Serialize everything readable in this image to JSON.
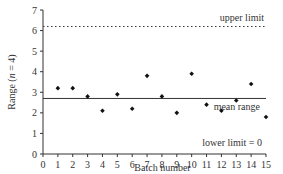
{
  "chart_data": {
    "type": "scatter",
    "title": "",
    "xlabel": "Batch number",
    "ylabel": "Range (n = 4)",
    "ylabel_parts": {
      "prefix": "Range (",
      "italic": "n",
      "suffix": " = 4)"
    },
    "xlim": [
      0,
      15
    ],
    "ylim": [
      0,
      7
    ],
    "x_ticks": [
      0,
      1,
      2,
      3,
      4,
      5,
      6,
      7,
      8,
      9,
      10,
      11,
      12,
      13,
      14,
      15
    ],
    "y_ticks": [
      0,
      1,
      2,
      3,
      4,
      5,
      6,
      7
    ],
    "grid": false,
    "x": [
      1,
      2,
      3,
      4,
      5,
      6,
      7,
      8,
      9,
      10,
      11,
      12,
      13,
      14,
      15
    ],
    "values": [
      3.2,
      3.2,
      2.8,
      2.1,
      2.9,
      2.2,
      3.8,
      2.8,
      2.0,
      3.9,
      2.4,
      2.1,
      2.6,
      3.4,
      1.8
    ],
    "reference_lines": [
      {
        "name": "upper limit",
        "value": 6.2,
        "style": "dotted",
        "label": "upper limit"
      },
      {
        "name": "mean range",
        "value": 2.7,
        "style": "solid",
        "label": "mean range"
      },
      {
        "name": "lower limit",
        "value": 0,
        "style": "axis",
        "label": "lower limit = 0"
      }
    ],
    "marker_color": "#111111",
    "line_color": "#333333"
  }
}
